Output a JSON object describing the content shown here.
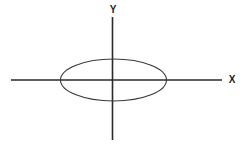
{
  "figure": {
    "background_color": "#ffffff",
    "stroke_color": "#2a2a2a",
    "ellipse_stroke_color": "#3a3a3a",
    "width": 246,
    "height": 146
  },
  "axes": {
    "y_label": "Y",
    "x_label": "X",
    "origin": {
      "x": 112.5,
      "y": 80
    },
    "x_axis": {
      "x_start": 11,
      "x_end": 222,
      "y": 80,
      "stroke_width": 1.6
    },
    "y_axis": {
      "y_start": 17,
      "y_end": 140,
      "x": 112.5,
      "stroke_width": 1.6
    }
  },
  "chart_data": {
    "type": "line",
    "xlabel": "X",
    "ylabel": "Y",
    "grid": false,
    "legend": null,
    "shapes": [
      {
        "name": "ellipse",
        "kind": "ellipse",
        "center_x": 113.5,
        "center_y": 80,
        "semi_axis_x": 53,
        "semi_axis_y": 21,
        "fill": "none",
        "stroke": "#3a3a3a",
        "stroke_width": 1.1
      }
    ],
    "annotations": [
      {
        "text": "Y",
        "x": 112.5,
        "y": 10,
        "role": "y-axis-tip-label"
      },
      {
        "text": "X",
        "x": 230,
        "y": 80,
        "role": "x-axis-tip-label"
      }
    ],
    "axis_ranges": {
      "x_pixels": [
        11,
        222
      ],
      "y_pixels": [
        17,
        140
      ]
    }
  }
}
